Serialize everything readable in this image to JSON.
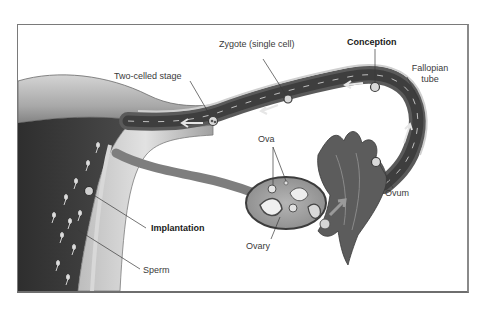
{
  "figure": {
    "labels": {
      "zygote": "Zygote (single cell)",
      "conception": "Conception",
      "two_celled": "Two-celled stage",
      "fallopian_line1": "Fallopian",
      "fallopian_line2": "tube",
      "ova": "Ova",
      "ovum": "Ovum",
      "ovary": "Ovary",
      "implantation": "Implantation",
      "sperm": "Sperm"
    },
    "bold_labels": [
      "Conception",
      "Implantation"
    ],
    "colors": {
      "frame": "#7a7a7a",
      "tissue_dark": "#3c3c3c",
      "tissue_mid": "#8c8c8c",
      "tissue_light": "#c8c8c8",
      "lumen": "#555555",
      "cell": "#d9d9d9"
    }
  }
}
